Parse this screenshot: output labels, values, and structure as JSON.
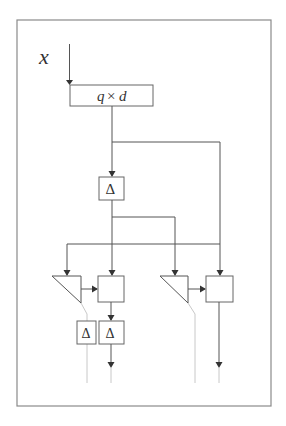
{
  "diagram": {
    "input_label": "x",
    "multiplier_block": {
      "label_q": "q",
      "label_times": "×",
      "label_d": "d"
    },
    "delay_label_main": "Δ",
    "delay_label_left": "Δ",
    "delay_label_right": "Δ",
    "colors": {
      "frame": "#8a8a8a",
      "wire": "#555555",
      "faint_wire": "#c8c8c8",
      "box_stroke": "#666666",
      "text": "#333333"
    }
  }
}
